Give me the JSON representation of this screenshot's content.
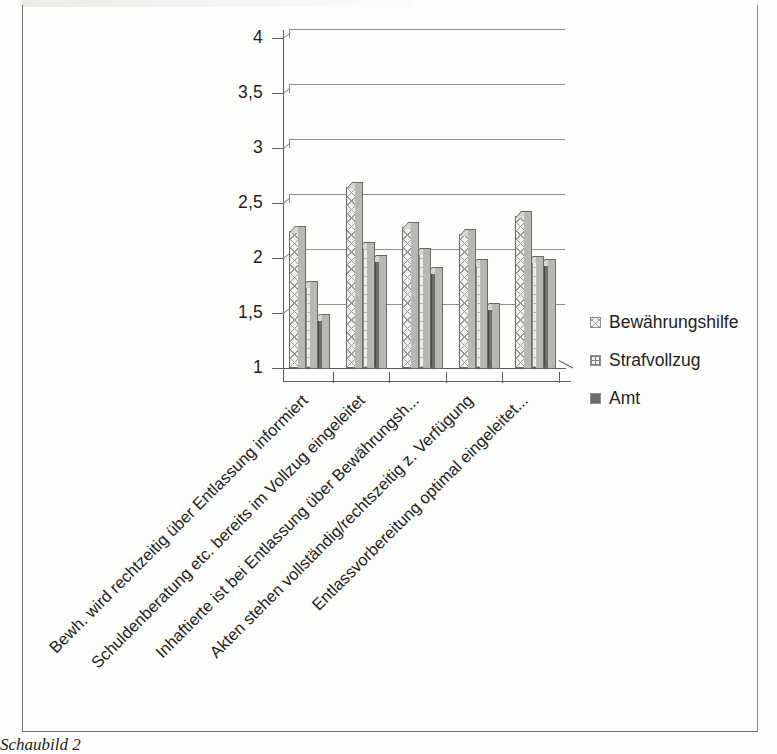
{
  "figure": {
    "caption": "Schaubild 2"
  },
  "chart_data": {
    "type": "bar",
    "title": "",
    "xlabel": "",
    "ylabel": "",
    "ylim": [
      1,
      4
    ],
    "ytick_labels": [
      "1",
      "1,5",
      "2",
      "2,5",
      "3",
      "3,5",
      "4"
    ],
    "ytick_values": [
      1,
      1.5,
      2,
      2.5,
      3,
      3.5,
      4
    ],
    "grid": true,
    "legend_position": "right",
    "style": "3d-clustered-column",
    "categories": [
      "Bewh. wird rechtzeitig über Entlassung informiert",
      "Schuldenberatung etc. bereits im Vollzug eingeleitet",
      "Inhaftierte ist bei Entlassung über Bewährungsh...",
      "Akten stehen vollständig/rechtszeitig z. Verfügung",
      "Entlassvorbereitung optimal eingeleitet..."
    ],
    "series": [
      {
        "name": "Bewährungshilfe",
        "pattern": "diagonal-crosshatch",
        "values": [
          2.25,
          2.65,
          2.28,
          2.22,
          2.38
        ]
      },
      {
        "name": "Strafvollzug",
        "pattern": "grid",
        "values": [
          1.75,
          2.1,
          2.05,
          1.95,
          1.97
        ]
      },
      {
        "name": "Amt",
        "pattern": "solid-dark",
        "values": [
          1.45,
          1.98,
          1.87,
          1.55,
          1.95
        ]
      }
    ]
  },
  "legend": {
    "items": [
      {
        "label": "Bewährungshilfe"
      },
      {
        "label": "Strafvollzug"
      },
      {
        "label": "Amt"
      }
    ]
  }
}
